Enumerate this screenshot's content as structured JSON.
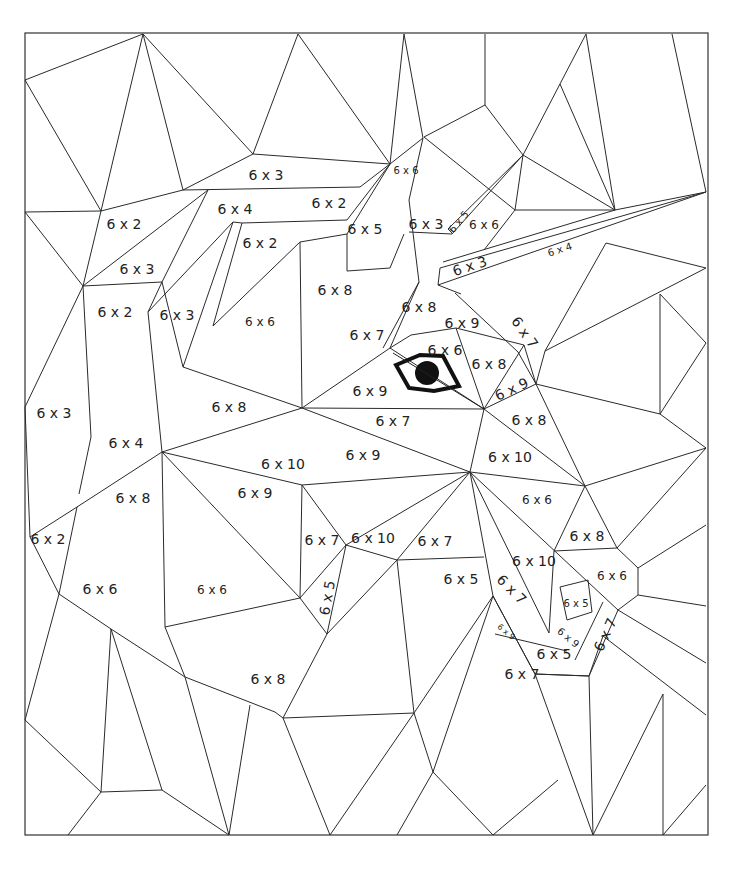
{
  "worksheet": {
    "title": "Color by multiplication - 6 times table",
    "frame": {
      "x": 25,
      "y": 33,
      "w": 683,
      "h": 802
    },
    "colors": {
      "line": "#2a2a2a",
      "background": "#ffffff",
      "eye": "#111111"
    }
  },
  "regions": [
    {
      "label": "6 x 3",
      "x": 266,
      "y": 176,
      "size": "l",
      "rot": 0
    },
    {
      "label": "6 x 2",
      "x": 124,
      "y": 225,
      "size": "l",
      "rot": 0
    },
    {
      "label": "6 x 4",
      "x": 235,
      "y": 210,
      "size": "l",
      "rot": 0
    },
    {
      "label": "6 x 2",
      "x": 329,
      "y": 204,
      "size": "l",
      "rot": 0
    },
    {
      "label": "6 x 6",
      "x": 406,
      "y": 171,
      "size": "s",
      "rot": 0
    },
    {
      "label": "6 x 5",
      "x": 365,
      "y": 230,
      "size": "l",
      "rot": 0
    },
    {
      "label": "6 x 3",
      "x": 426,
      "y": 225,
      "size": "l",
      "rot": 0
    },
    {
      "label": "6 x 5",
      "x": 459,
      "y": 222,
      "size": "s",
      "rot": -50
    },
    {
      "label": "6 x 6",
      "x": 484,
      "y": 225,
      "size": "m",
      "rot": 0
    },
    {
      "label": "6 x 3",
      "x": 470,
      "y": 267,
      "size": "l",
      "rot": -18
    },
    {
      "label": "6 x 4",
      "x": 560,
      "y": 250,
      "size": "s",
      "rot": -18
    },
    {
      "label": "6 x 2",
      "x": 260,
      "y": 244,
      "size": "l",
      "rot": 0
    },
    {
      "label": "6 x 3",
      "x": 137,
      "y": 270,
      "size": "l",
      "rot": 0
    },
    {
      "label": "6 x 2",
      "x": 115,
      "y": 313,
      "size": "l",
      "rot": 0
    },
    {
      "label": "6 x 3",
      "x": 177,
      "y": 316,
      "size": "l",
      "rot": 0
    },
    {
      "label": "6 x 6",
      "x": 260,
      "y": 322,
      "size": "m",
      "rot": 0
    },
    {
      "label": "6 x 8",
      "x": 335,
      "y": 291,
      "size": "l",
      "rot": 0
    },
    {
      "label": "6 x 8",
      "x": 419,
      "y": 308,
      "size": "l",
      "rot": 0
    },
    {
      "label": "6 x 7",
      "x": 367,
      "y": 336,
      "size": "l",
      "rot": 0
    },
    {
      "label": "6 x 9",
      "x": 462,
      "y": 324,
      "size": "l",
      "rot": 0
    },
    {
      "label": "6 x 7",
      "x": 524,
      "y": 333,
      "size": "l",
      "rot": 55
    },
    {
      "label": "6 x 6",
      "x": 445,
      "y": 351,
      "size": "l",
      "rot": 0
    },
    {
      "label": "6 x 8",
      "x": 489,
      "y": 365,
      "size": "l",
      "rot": 0
    },
    {
      "label": "6 x 9",
      "x": 512,
      "y": 390,
      "size": "l",
      "rot": -25
    },
    {
      "label": "6 x 3",
      "x": 54,
      "y": 414,
      "size": "l",
      "rot": 0
    },
    {
      "label": "6 x 8",
      "x": 229,
      "y": 408,
      "size": "l",
      "rot": 0
    },
    {
      "label": "6 x 9",
      "x": 370,
      "y": 392,
      "size": "l",
      "rot": 0
    },
    {
      "label": "6 x 7",
      "x": 393,
      "y": 422,
      "size": "l",
      "rot": 0
    },
    {
      "label": "6 x 8",
      "x": 529,
      "y": 421,
      "size": "l",
      "rot": 0
    },
    {
      "label": "6 x 4",
      "x": 126,
      "y": 444,
      "size": "l",
      "rot": 0
    },
    {
      "label": "6 x 10",
      "x": 283,
      "y": 465,
      "size": "l",
      "rot": 0
    },
    {
      "label": "6 x 9",
      "x": 363,
      "y": 456,
      "size": "l",
      "rot": 0
    },
    {
      "label": "6 x 10",
      "x": 510,
      "y": 458,
      "size": "l",
      "rot": 0
    },
    {
      "label": "6 x 9",
      "x": 255,
      "y": 494,
      "size": "l",
      "rot": 0
    },
    {
      "label": "6 x 6",
      "x": 537,
      "y": 500,
      "size": "m",
      "rot": 0
    },
    {
      "label": "6 x 8",
      "x": 133,
      "y": 499,
      "size": "l",
      "rot": 0
    },
    {
      "label": "6 x 2",
      "x": 48,
      "y": 540,
      "size": "l",
      "rot": 0
    },
    {
      "label": "6 x 7",
      "x": 322,
      "y": 541,
      "size": "l",
      "rot": 0
    },
    {
      "label": "6 x 10",
      "x": 373,
      "y": 539,
      "size": "l",
      "rot": 0
    },
    {
      "label": "6 x 7",
      "x": 435,
      "y": 542,
      "size": "l",
      "rot": 0
    },
    {
      "label": "6 x 8",
      "x": 587,
      "y": 537,
      "size": "l",
      "rot": 0
    },
    {
      "label": "6 x 10",
      "x": 534,
      "y": 562,
      "size": "l",
      "rot": 0
    },
    {
      "label": "6 x 6",
      "x": 612,
      "y": 576,
      "size": "m",
      "rot": 0
    },
    {
      "label": "6 x 6",
      "x": 100,
      "y": 590,
      "size": "l",
      "rot": 0
    },
    {
      "label": "6 x 6",
      "x": 212,
      "y": 590,
      "size": "m",
      "rot": 0
    },
    {
      "label": "6 x 5",
      "x": 461,
      "y": 580,
      "size": "l",
      "rot": 0
    },
    {
      "label": "6 x 7",
      "x": 511,
      "y": 590,
      "size": "l",
      "rot": 45
    },
    {
      "label": "6 x 5",
      "x": 328,
      "y": 598,
      "size": "l",
      "rot": -80
    },
    {
      "label": "6 x 5",
      "x": 576,
      "y": 604,
      "size": "s",
      "rot": 0
    },
    {
      "label": "6 x 9",
      "x": 506,
      "y": 632,
      "size": "xs",
      "rot": 40
    },
    {
      "label": "6 x 9",
      "x": 568,
      "y": 638,
      "size": "s",
      "rot": 40
    },
    {
      "label": "6 x 7",
      "x": 606,
      "y": 635,
      "size": "l",
      "rot": -65
    },
    {
      "label": "6 x 5",
      "x": 554,
      "y": 655,
      "size": "l",
      "rot": 0
    },
    {
      "label": "6 x 7",
      "x": 522,
      "y": 675,
      "size": "l",
      "rot": 0
    },
    {
      "label": "6 x 8",
      "x": 268,
      "y": 680,
      "size": "l",
      "rot": 0
    }
  ],
  "eye": {
    "label": "eye-of-bird"
  }
}
